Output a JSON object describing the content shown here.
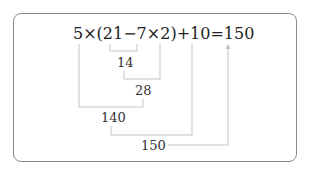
{
  "diagram": {
    "expression": "5×(21−7×2)+10=150",
    "expression_parts": {
      "five": "5",
      "times1": "×",
      "lparen": "(",
      "twentyone": "21",
      "minus": "−",
      "seven": "7",
      "times2": "×",
      "two": "2",
      "rparen": ")",
      "plus": "+",
      "ten": "10",
      "equals": "=",
      "result": "150"
    },
    "steps": [
      {
        "id": "step1",
        "operation": "7×2",
        "value": "14"
      },
      {
        "id": "step2",
        "operation": "21−14",
        "value": "7",
        "displayed_value": "28"
      },
      {
        "id": "step3",
        "operation": "5×28",
        "value": "140"
      },
      {
        "id": "step4",
        "operation": "140+10",
        "value": "150"
      }
    ],
    "intermediate_labels": {
      "l14": "14",
      "l28": "28",
      "l140": "140",
      "l150": "150"
    },
    "colors": {
      "border": "#8a8a8a",
      "lines": "#c4c4c4",
      "text": "#222222"
    }
  }
}
